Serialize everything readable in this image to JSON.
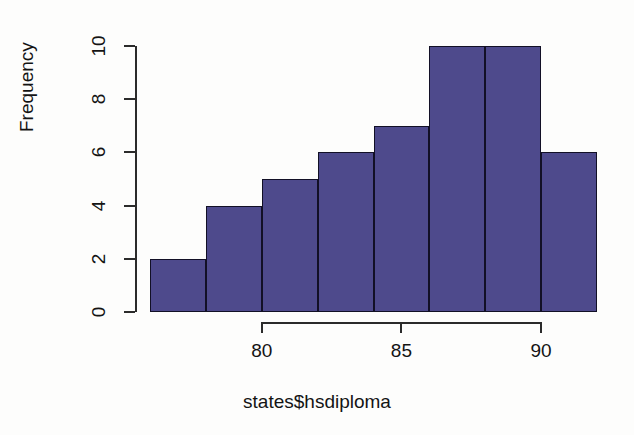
{
  "chart_data": {
    "type": "bar",
    "title": "",
    "xlabel": "states$hsdiploma",
    "ylabel": "Frequency",
    "bin_edges": [
      76,
      78,
      80,
      82,
      84,
      86,
      88,
      90,
      92
    ],
    "categories": [
      "76-78",
      "78-80",
      "80-82",
      "82-84",
      "84-86",
      "86-88",
      "88-90",
      "90-92"
    ],
    "values": [
      2,
      4,
      5,
      6,
      7,
      10,
      10,
      6
    ],
    "bar_color": "#4e4a8c",
    "bar_border_color": "#121026",
    "xlim": [
      76,
      92
    ],
    "ylim": [
      0,
      10
    ],
    "xticks": [
      80,
      85,
      90
    ],
    "xtick_labels": [
      "80",
      "85",
      "90"
    ],
    "yticks": [
      0,
      2,
      4,
      6,
      8,
      10
    ],
    "ytick_labels": [
      "0",
      "2",
      "4",
      "6",
      "8",
      "10"
    ],
    "grid": false,
    "legend": null
  },
  "axes": {
    "y_axis_name": "y-axis",
    "x_axis_name": "x-axis"
  }
}
